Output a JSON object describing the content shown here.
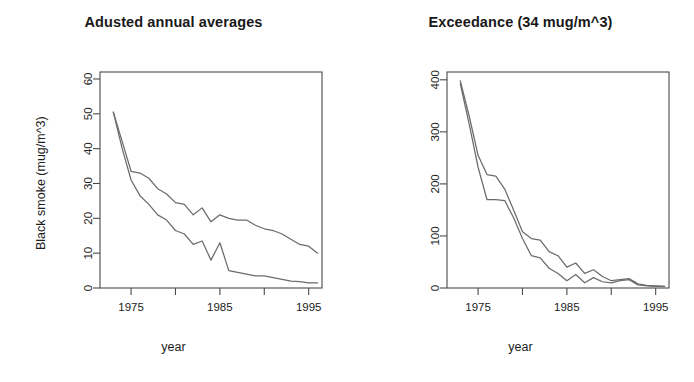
{
  "figure": {
    "background": "#ffffff",
    "line_color": "#6b6b6b",
    "axis_color": "#4a4a4a"
  },
  "panels": {
    "left": {
      "title": "Adusted annual averages",
      "xlabel": "year",
      "ylabel": "Black smoke (mug/m^3)"
    },
    "right": {
      "title": "Exceedance (34 mug/m^3)",
      "xlabel": "year",
      "ylabel": "Number of sites"
    }
  },
  "chart_data": [
    {
      "type": "line",
      "title": "Adusted annual averages",
      "xlabel": "year",
      "ylabel": "Black smoke (mug/m^3)",
      "xlim": [
        1971.5,
        1996.5
      ],
      "ylim": [
        0,
        62
      ],
      "xticks": [
        1975,
        1980,
        1985,
        1990,
        1995
      ],
      "xticklabels": [
        "1975",
        "",
        "1985",
        "",
        "1995"
      ],
      "yticks": [
        0,
        10,
        20,
        30,
        40,
        50,
        60
      ],
      "yticklabels": [
        "0",
        "10",
        "20",
        "30",
        "40",
        "50",
        "60"
      ],
      "grid": false,
      "legend": "none",
      "x": [
        1973,
        1974,
        1975,
        1976,
        1977,
        1978,
        1979,
        1980,
        1981,
        1982,
        1983,
        1984,
        1985,
        1986,
        1987,
        1988,
        1989,
        1990,
        1991,
        1992,
        1993,
        1994,
        1995,
        1996
      ],
      "series": [
        {
          "name": "upper",
          "values": [
            50.5,
            42.0,
            33.5,
            33.0,
            31.5,
            28.5,
            27.0,
            24.5,
            24.0,
            21.0,
            23.0,
            19.0,
            21.0,
            20.0,
            19.5,
            19.5,
            18.0,
            17.0,
            16.5,
            15.5,
            14.0,
            12.5,
            12.0,
            10.0
          ]
        },
        {
          "name": "lower",
          "values": [
            50.5,
            40.0,
            31.0,
            26.5,
            24.0,
            21.0,
            19.5,
            16.5,
            15.5,
            12.5,
            13.5,
            8.0,
            13.0,
            5.0,
            4.5,
            4.0,
            3.5,
            3.5,
            3.0,
            2.5,
            2.0,
            1.8,
            1.5,
            1.5
          ]
        }
      ]
    },
    {
      "type": "line",
      "title": "Exceedance (34 mug/m^3)",
      "xlabel": "year",
      "ylabel": "Number of sites",
      "xlim": [
        1971.5,
        1996.5
      ],
      "ylim": [
        0,
        415
      ],
      "xticks": [
        1975,
        1980,
        1985,
        1990,
        1995
      ],
      "xticklabels": [
        "1975",
        "",
        "1985",
        "",
        "1995"
      ],
      "yticks": [
        0,
        100,
        200,
        300,
        400
      ],
      "yticklabels": [
        "0",
        "100",
        "200",
        "300",
        "400"
      ],
      "grid": false,
      "legend": "none",
      "x": [
        1973,
        1974,
        1975,
        1976,
        1977,
        1978,
        1979,
        1980,
        1981,
        1982,
        1983,
        1984,
        1985,
        1986,
        1987,
        1988,
        1989,
        1990,
        1991,
        1992,
        1993,
        1994,
        1995,
        1996
      ],
      "series": [
        {
          "name": "upper",
          "values": [
            398,
            330,
            255,
            218,
            215,
            190,
            150,
            108,
            95,
            92,
            70,
            62,
            40,
            48,
            28,
            35,
            22,
            14,
            16,
            18,
            8,
            5,
            4,
            3
          ]
        },
        {
          "name": "lower",
          "values": [
            392,
            315,
            232,
            170,
            170,
            168,
            135,
            95,
            62,
            58,
            38,
            28,
            14,
            26,
            10,
            20,
            12,
            10,
            14,
            16,
            6,
            4,
            3,
            3
          ]
        }
      ]
    }
  ]
}
